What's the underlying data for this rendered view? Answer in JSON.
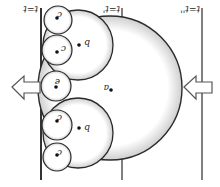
{
  "diagram": {
    "orientation": "rotated 180 degrees",
    "line_labels": {
      "t1": "t=t",
      "t2": "t=t'",
      "t3": "t=t''"
    },
    "point_labels": {
      "a": "a",
      "b_top": "b",
      "b_bottom": "b",
      "c1": "c",
      "c2": "c",
      "c3": "c",
      "c4": "c",
      "e": "e"
    },
    "arrows": {
      "left": "arrow pointing left (outward)",
      "right": "arrow pointing left (inward)"
    },
    "colors": {
      "stroke": "#2a2a2a",
      "shade": "#bdbdbd"
    }
  }
}
